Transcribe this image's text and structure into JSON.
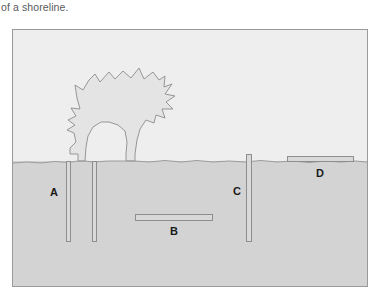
{
  "caption": {
    "text": "of a shoreline."
  },
  "figure": {
    "name": "shoreline-cross-section-diagram",
    "regions": {
      "water_label": "water",
      "land_label": "land"
    },
    "colors": {
      "frame_border": "#9a9a9a",
      "upper_region": "#eeeeee",
      "lower_region": "#d3d3d3",
      "bar_fill": "#d9d9d9",
      "bar_stroke": "#8e8e8e",
      "landmass_fill": "#e4e4e4",
      "landmass_stroke": "#888888",
      "label_color": "#1a1a1a"
    },
    "landmass": {
      "name": "tree-shaped-landmass",
      "description": "jagged star shaped landmass with narrow trunk reaching the shoreline"
    },
    "shoreline": {
      "name": "shoreline-boundary",
      "description": "irregular near horizontal boundary line"
    },
    "markers": [
      {
        "id": "A",
        "label": "A",
        "name": "marker-a",
        "orientation": "vertical",
        "position": "below-shoreline-left"
      },
      {
        "id": "B",
        "label": "B",
        "name": "marker-b",
        "orientation": "horizontal",
        "position": "below-shoreline-center"
      },
      {
        "id": "C",
        "label": "C",
        "name": "marker-c",
        "orientation": "vertical",
        "position": "crossing-shoreline-right"
      },
      {
        "id": "D",
        "label": "D",
        "name": "marker-d",
        "orientation": "horizontal",
        "position": "above-shoreline-right"
      }
    ]
  }
}
